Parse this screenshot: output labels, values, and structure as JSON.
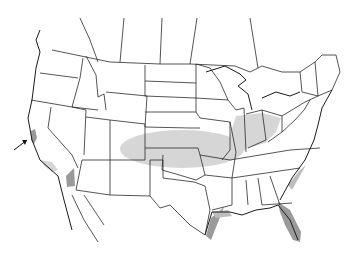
{
  "map": {
    "region": "United States, southern Canada and northern Mexico",
    "colors": {
      "background": "#ffffff",
      "border": "#2a2a2a",
      "range_light": "#d6d6d6",
      "range_dark": "#9a9a9a"
    },
    "shaded_ranges": [
      {
        "name": "california-central-coast",
        "shade": "dark"
      },
      {
        "name": "california-south-coast",
        "shade": "light"
      },
      {
        "name": "colorado-river-valley",
        "shade": "dark"
      },
      {
        "name": "kansas-oklahoma-plains",
        "shade": "light"
      },
      {
        "name": "ohio-valley",
        "shade": "light"
      },
      {
        "name": "gulf-coast-texas",
        "shade": "dark"
      },
      {
        "name": "florida-peninsula",
        "shade": "dark"
      },
      {
        "name": "atlantic-coast-georgia-carolinas",
        "shade": "light"
      }
    ],
    "annotation": {
      "type": "arrow",
      "target": "california-central-coast"
    }
  }
}
